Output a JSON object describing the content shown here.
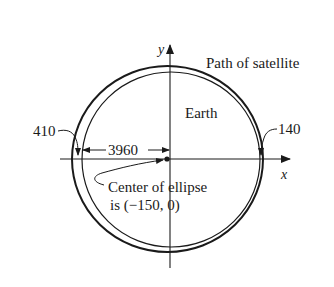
{
  "diagram": {
    "labels": {
      "path_of_satellite": "Path of satellite",
      "earth": "Earth",
      "left_distance": "410",
      "right_distance": "140",
      "earth_radius": "3960",
      "center_line1": "Center of ellipse",
      "center_line2": "is (−150, 0)",
      "x_axis": "x",
      "y_axis": "y"
    },
    "colors": {
      "ink": "#1a1a1a",
      "background": "#ffffff"
    }
  }
}
